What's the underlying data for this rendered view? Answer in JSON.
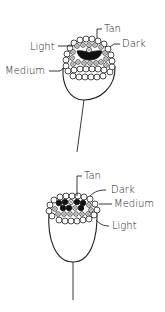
{
  "diagrams": [
    {
      "id": "top",
      "labels": {
        "tan": "Tan",
        "light": "Light",
        "dark": "Dark",
        "medium": "Medium"
      }
    },
    {
      "id": "bottom",
      "labels": {
        "tan": "Tan",
        "dark": "Dark",
        "medium": "Medium",
        "light": "Light"
      }
    }
  ],
  "colors": {
    "line": "#222222",
    "dark_floret": "#111111",
    "background": "#ffffff"
  }
}
